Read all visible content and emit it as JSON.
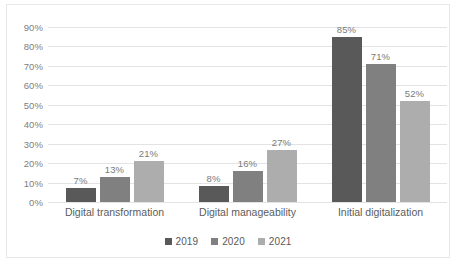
{
  "chart_data": {
    "type": "bar",
    "title": "",
    "xlabel": "",
    "ylabel": "",
    "ylim": [
      0,
      90
    ],
    "ytick_step": 10,
    "grid": true,
    "legend_position": "bottom",
    "value_suffix": "%",
    "categories": [
      "Digital transformation",
      "Digital manageability",
      "Initial digitalization"
    ],
    "series": [
      {
        "name": "2019",
        "color": "#595959",
        "values": [
          7,
          8,
          85
        ],
        "labels": [
          "7%",
          "8%",
          "85%"
        ]
      },
      {
        "name": "2020",
        "color": "#808080",
        "values": [
          13,
          16,
          71
        ],
        "labels": [
          "13%",
          "16%",
          "71%"
        ]
      },
      {
        "name": "2021",
        "color": "#adadad",
        "values": [
          21,
          27,
          52
        ],
        "labels": [
          "21%",
          "27%",
          "52%"
        ]
      }
    ],
    "ytick_labels": [
      "90%",
      "80%",
      "70%",
      "60%",
      "50%",
      "40%",
      "30%",
      "20%",
      "10%",
      "0%"
    ],
    "ytick_values": [
      90,
      80,
      70,
      60,
      50,
      40,
      30,
      20,
      10,
      0
    ]
  },
  "colors": {
    "series_2019": "#595959",
    "series_2020": "#808080",
    "series_2021": "#adadad",
    "gridline": "#e3e3e3",
    "border": "#e8e8e8",
    "tick_text": "#808080",
    "category_text": "#5c5c5c",
    "data_label_text": "#7a7a7a",
    "legend_text": "#595959"
  },
  "legend": {
    "items": [
      {
        "label": "2019",
        "color": "#595959"
      },
      {
        "label": "2020",
        "color": "#808080"
      },
      {
        "label": "2021",
        "color": "#adadad"
      }
    ]
  }
}
